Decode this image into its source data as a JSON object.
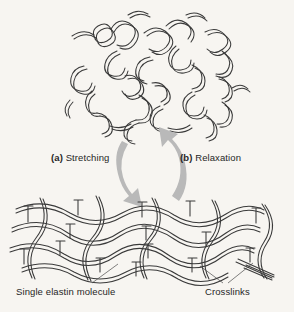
{
  "figure": {
    "background_color": "#f7f5f1",
    "ink_color": "#3a3a3a",
    "arrow_color": "#b9b9b9",
    "text_color": "#262626"
  },
  "labels": {
    "stretching": {
      "tag": "(a)",
      "text": " Stretching"
    },
    "relaxation": {
      "tag": "(b)",
      "text": " Relaxation"
    },
    "single_elastin": "Single elastin molecule",
    "crosslinks": "Crosslinks"
  },
  "regions": {
    "coiled_state": "relaxed-coiled-elastin-network",
    "stretched_state": "stretched-elastin-network"
  },
  "arrows": {
    "stretching_arrow": "curved-arrow-down-left",
    "relaxation_arrow": "curved-arrow-up-right"
  }
}
